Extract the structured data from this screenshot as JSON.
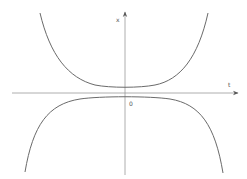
{
  "diagram": {
    "type": "phase/solution curves plot",
    "axes": {
      "horizontal_label": "t",
      "vertical_label": "x",
      "origin_label": "0"
    },
    "curves": [
      {
        "name": "upper-solution-curve",
        "shape": "U-shaped, opening upward, minimum slightly above t-axis at t=0"
      },
      {
        "name": "lower-solution-curve",
        "shape": "inverted U, opening downward, maximum slightly below t-axis at t=0"
      }
    ],
    "colors": {
      "axis": "#888888",
      "curve": "#6a6a6a",
      "background": "#ffffff"
    }
  }
}
